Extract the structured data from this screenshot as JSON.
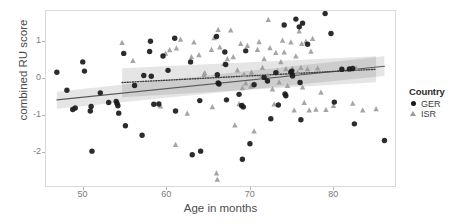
{
  "chart_data": {
    "type": "scatter",
    "title": "",
    "xlabel": "Age in months",
    "ylabel": "combined RU score",
    "xlim": [
      45.5,
      87.5
    ],
    "ylim": [
      -2.95,
      1.85
    ],
    "xticks": [
      50,
      60,
      70,
      80
    ],
    "yticks": [
      1,
      0,
      -1,
      -2
    ],
    "xtick_labels": [
      "50",
      "60",
      "70",
      "80"
    ],
    "ytick_labels": [
      "1",
      "0",
      "-1",
      "-2"
    ],
    "grid": false,
    "legend": {
      "position": "right",
      "title": "Country",
      "entries": [
        {
          "label": "GER",
          "marker": "circle",
          "color": "#1a1a1a"
        },
        {
          "label": "ISR",
          "marker": "triangle",
          "color": "#9b9b9b"
        }
      ]
    },
    "series": [
      {
        "name": "GER",
        "marker": "circle",
        "color": "#1a1a1a",
        "points": [
          [
            46.8,
            0.19
          ],
          [
            48.0,
            -0.3
          ],
          [
            48.7,
            -0.82
          ],
          [
            49.0,
            -0.78
          ],
          [
            49.9,
            0.47
          ],
          [
            50.1,
            0.22
          ],
          [
            50.8,
            -0.86
          ],
          [
            50.9,
            -0.74
          ],
          [
            51.0,
            -1.95
          ],
          [
            52.0,
            -0.37
          ],
          [
            53.0,
            -0.63
          ],
          [
            53.9,
            -0.6
          ],
          [
            54.0,
            -0.66
          ],
          [
            54.1,
            -0.72
          ],
          [
            54.2,
            -0.92
          ],
          [
            54.8,
            0.7
          ],
          [
            55.0,
            -1.26
          ],
          [
            56.1,
            -0.17
          ],
          [
            57.0,
            -1.52
          ],
          [
            57.2,
            0.1
          ],
          [
            57.9,
            0.75
          ],
          [
            58.0,
            1.03
          ],
          [
            58.1,
            0.08
          ],
          [
            58.4,
            -0.68
          ],
          [
            59.0,
            -0.67
          ],
          [
            59.5,
            0.63
          ],
          [
            60.1,
            0.24
          ],
          [
            60.9,
            1.11
          ],
          [
            61.0,
            -0.86
          ],
          [
            62.8,
            0.47
          ],
          [
            63.0,
            -2.05
          ],
          [
            63.9,
            -0.58
          ],
          [
            64.0,
            -1.95
          ],
          [
            65.9,
            1.16
          ],
          [
            66.0,
            0.12
          ],
          [
            66.1,
            -0.1
          ],
          [
            66.2,
            -0.13
          ],
          [
            66.9,
            0.74
          ],
          [
            67.0,
            0.4
          ],
          [
            67.1,
            -0.56
          ],
          [
            68.6,
            -0.41
          ],
          [
            68.9,
            -0.71
          ],
          [
            69.0,
            -2.17
          ],
          [
            69.1,
            -0.75
          ],
          [
            69.4,
            0.77
          ],
          [
            69.9,
            -1.75
          ],
          [
            70.4,
            -0.15
          ],
          [
            71.6,
            0.05
          ],
          [
            72.0,
            -0.05
          ],
          [
            72.4,
            -1.07
          ],
          [
            73.0,
            0.18
          ],
          [
            73.3,
            -0.7
          ],
          [
            74.0,
            1.47
          ],
          [
            74.1,
            -0.4
          ],
          [
            74.2,
            -0.45
          ],
          [
            74.8,
            0.19
          ],
          [
            74.9,
            0.22
          ],
          [
            75.0,
            0.09
          ],
          [
            75.4,
            1.63
          ],
          [
            75.8,
            1.42
          ],
          [
            75.9,
            -0.09
          ],
          [
            76.0,
            -1.1
          ],
          [
            76.2,
            1.52
          ],
          [
            76.8,
            0.95
          ],
          [
            78.9,
            1.78
          ],
          [
            79.6,
            1.24
          ],
          [
            80.0,
            -0.62
          ],
          [
            80.9,
            0.27
          ],
          [
            81.8,
            0.28
          ],
          [
            82.2,
            0.29
          ],
          [
            82.4,
            -1.21
          ],
          [
            86.0,
            -1.66
          ]
        ]
      },
      {
        "name": "ISR",
        "marker": "triangle",
        "color": "#9b9b9b",
        "points": [
          [
            54.6,
            0.99
          ],
          [
            55.9,
            0.5
          ],
          [
            59.2,
            -0.73
          ],
          [
            59.8,
            0.7
          ],
          [
            60.3,
            0.79
          ],
          [
            61.0,
            -1.78
          ],
          [
            61.1,
            0.84
          ],
          [
            61.6,
            1.08
          ],
          [
            62.4,
            -0.93
          ],
          [
            62.9,
            0.6
          ],
          [
            63.2,
            1.0
          ],
          [
            63.8,
            0.66
          ],
          [
            64.4,
            0.12
          ],
          [
            64.5,
            0.17
          ],
          [
            65.3,
            0.8
          ],
          [
            65.4,
            -0.75
          ],
          [
            65.6,
            1.12
          ],
          [
            65.9,
            -2.55
          ],
          [
            66.0,
            -2.72
          ],
          [
            66.1,
            1.34
          ],
          [
            66.3,
            0.87
          ],
          [
            66.8,
            0.42
          ],
          [
            67.2,
            0.55
          ],
          [
            67.6,
            1.33
          ],
          [
            67.9,
            0.6
          ],
          [
            68.1,
            -1.25
          ],
          [
            68.4,
            0.24
          ],
          [
            68.6,
            -0.67
          ],
          [
            68.8,
            0.96
          ],
          [
            69.0,
            -0.24
          ],
          [
            69.1,
            -0.7
          ],
          [
            69.2,
            0.13
          ],
          [
            69.4,
            -0.11
          ],
          [
            69.6,
            0.91
          ],
          [
            70.0,
            -0.2
          ],
          [
            70.1,
            0.18
          ],
          [
            70.4,
            -1.41
          ],
          [
            70.8,
            0.8
          ],
          [
            71.0,
            1.01
          ],
          [
            71.2,
            0.05
          ],
          [
            71.4,
            0.31
          ],
          [
            71.6,
            0.55
          ],
          [
            72.0,
            0.1
          ],
          [
            72.1,
            1.61
          ],
          [
            72.3,
            0.85
          ],
          [
            72.6,
            -0.27
          ],
          [
            72.8,
            -0.68
          ],
          [
            73.0,
            0.72
          ],
          [
            73.2,
            0.22
          ],
          [
            73.4,
            -0.08
          ],
          [
            73.6,
            0.47
          ],
          [
            73.8,
            1.05
          ],
          [
            74.0,
            0.73
          ],
          [
            74.2,
            0.28
          ],
          [
            74.4,
            -0.18
          ],
          [
            74.6,
            0.16
          ],
          [
            74.8,
            1.0
          ],
          [
            75.0,
            0.29
          ],
          [
            75.2,
            -0.84
          ],
          [
            75.4,
            0.62
          ],
          [
            75.6,
            0.18
          ],
          [
            75.8,
            1.3
          ],
          [
            76.0,
            0.31
          ],
          [
            76.1,
            0.96
          ],
          [
            76.2,
            -0.22
          ],
          [
            76.4,
            -0.64
          ],
          [
            76.6,
            1.02
          ],
          [
            76.8,
            0.28
          ],
          [
            77.0,
            -0.84
          ],
          [
            77.2,
            0.75
          ],
          [
            77.4,
            1.1
          ],
          [
            77.8,
            -0.82
          ],
          [
            78.0,
            0.3
          ],
          [
            78.4,
            -0.36
          ],
          [
            79.0,
            -0.83
          ],
          [
            79.9,
            -0.72
          ],
          [
            82.2,
            -0.66
          ],
          [
            82.6,
            0.3
          ],
          [
            83.4,
            -0.84
          ],
          [
            85.0,
            -0.81
          ]
        ]
      }
    ],
    "fits": [
      {
        "name": "GER",
        "linestyle": "solid",
        "color": "#595959",
        "x_start": 46.8,
        "x_end": 86.0,
        "y_start": -0.56,
        "y_end": 0.35,
        "ribbon_upper_start": -0.34,
        "ribbon_upper_end": 0.62,
        "ribbon_lower_start": -0.8,
        "ribbon_lower_end": 0.09
      },
      {
        "name": "ISR",
        "linestyle": "dotted",
        "color": "#3d3d3d",
        "x_start": 54.6,
        "x_end": 85.0,
        "y_start": -0.09,
        "y_end": 0.27,
        "ribbon_upper_start": 0.3,
        "ribbon_upper_end": 0.62,
        "ribbon_lower_start": -0.49,
        "ribbon_lower_end": -0.08
      }
    ]
  }
}
